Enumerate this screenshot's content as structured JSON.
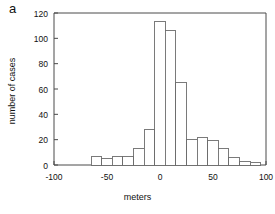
{
  "panel": {
    "label": "a"
  },
  "chart_data": {
    "type": "bar",
    "subtype": "histogram",
    "title": "",
    "subtitle": "",
    "xlabel": "meters",
    "ylabel": "number of cases",
    "xlim": [
      -100,
      100
    ],
    "ylim": [
      0,
      120
    ],
    "xticks": [
      -100,
      -50,
      0,
      50,
      100
    ],
    "xtick_labels": [
      "-100",
      "-50",
      "0",
      "50",
      "100"
    ],
    "yticks": [
      0,
      20,
      40,
      60,
      80,
      100,
      120
    ],
    "ytick_labels": [
      "0",
      "20",
      "40",
      "60",
      "80",
      "100",
      "120"
    ],
    "grid": false,
    "legend": null,
    "bin_width": 10,
    "bin_edges": [
      -65,
      -55,
      -45,
      -35,
      -25,
      -15,
      -5,
      5,
      15,
      25,
      35,
      45,
      55,
      65,
      75,
      85,
      95
    ],
    "bin_centers": [
      -60,
      -50,
      -40,
      -30,
      -20,
      -10,
      0,
      10,
      20,
      30,
      40,
      50,
      60,
      70,
      80,
      90
    ],
    "values": [
      7,
      5,
      7,
      7,
      13,
      28,
      113,
      106,
      65,
      20,
      22,
      19,
      13,
      6,
      3,
      2
    ],
    "bar_fill_color": "#ffffff",
    "bar_edge_color": "#6b6b6b",
    "axis_color": "#4a4a4a"
  }
}
